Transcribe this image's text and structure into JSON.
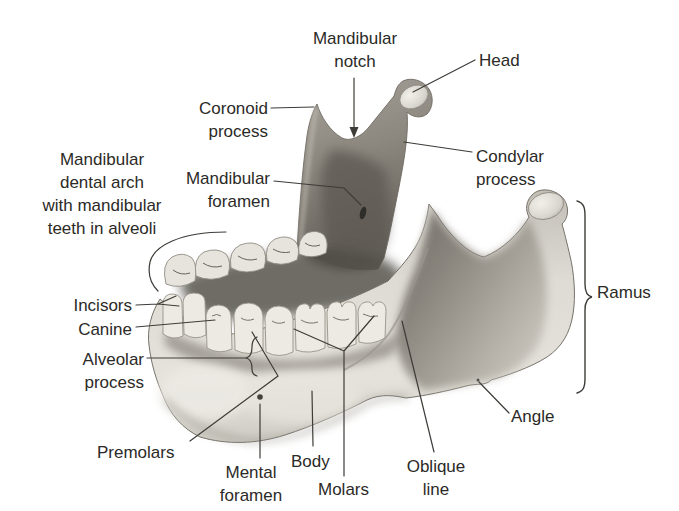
{
  "diagram": {
    "style": "shaded pencil anatomical illustration, oblique view, white background"
  },
  "labels": {
    "mandibular_notch": {
      "lines": [
        "Mandibular",
        "notch"
      ]
    },
    "head": {
      "lines": [
        "Head"
      ]
    },
    "coronoid_process": {
      "lines": [
        "Coronoid",
        "process"
      ]
    },
    "condylar_process": {
      "lines": [
        "Condylar",
        "process"
      ]
    },
    "mandibular_dental_arch": {
      "lines": [
        "Mandibular",
        "dental arch",
        "with mandibular",
        "teeth in alveoli"
      ]
    },
    "mandibular_foramen": {
      "lines": [
        "Mandibular",
        "foramen"
      ]
    },
    "incisors": {
      "lines": [
        "Incisors"
      ]
    },
    "canine": {
      "lines": [
        "Canine"
      ]
    },
    "alveolar_process": {
      "lines": [
        "Alveolar",
        "process"
      ]
    },
    "premolars": {
      "lines": [
        "Premolars"
      ]
    },
    "mental_foramen": {
      "lines": [
        "Mental",
        "foramen"
      ]
    },
    "body": {
      "lines": [
        "Body"
      ]
    },
    "molars": {
      "lines": [
        "Molars"
      ]
    },
    "oblique_line": {
      "lines": [
        "Oblique",
        "line"
      ]
    },
    "angle": {
      "lines": [
        "Angle"
      ]
    },
    "ramus": {
      "lines": [
        "Ramus"
      ]
    }
  },
  "colors": {
    "background": "#ffffff",
    "text": "#2b2a27",
    "leader_line": "#3e3c38",
    "bone_light": "#e4e1da",
    "bone_mid": "#aaa69d",
    "bone_dark": "#5f5b54",
    "teeth": "#edeae3",
    "foramen_dark": "#2f2d29"
  }
}
